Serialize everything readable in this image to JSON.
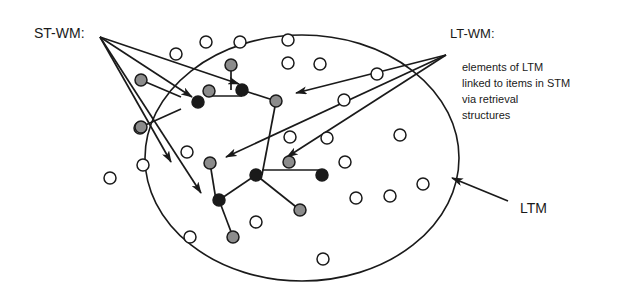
{
  "diagram": {
    "labels": {
      "st_wm": "ST-WM:",
      "lt_wm": "LT-WM:",
      "lt_wm_description": [
        "elements of LTM",
        "linked to items in STM",
        "via retrieval",
        "structures"
      ],
      "ltm": "LTM"
    },
    "colors": {
      "stroke": "#1a1a1a",
      "open_node_fill": "#ffffff",
      "gray_node_fill": "#8c8c8c",
      "dark_node_fill": "#1a1a1a",
      "background": "#ffffff"
    },
    "ltm_ellipse": {
      "cx": 302,
      "cy": 158,
      "rx": 157,
      "ry": 123
    },
    "node_radius": 6,
    "open_nodes": [
      [
        206,
        42
      ],
      [
        240,
        42
      ],
      [
        288,
        40
      ],
      [
        176,
        54
      ],
      [
        288,
        63
      ],
      [
        320,
        64
      ],
      [
        377,
        74
      ],
      [
        344,
        100
      ],
      [
        400,
        135
      ],
      [
        290,
        137
      ],
      [
        327,
        138
      ],
      [
        187,
        152
      ],
      [
        140,
        128
      ],
      [
        143,
        165
      ],
      [
        110,
        178
      ],
      [
        345,
        162
      ],
      [
        390,
        196
      ],
      [
        356,
        198
      ],
      [
        423,
        184
      ],
      [
        256,
        222
      ],
      [
        190,
        237
      ],
      [
        323,
        259
      ]
    ],
    "gray_nodes": [
      [
        231,
        65
      ],
      [
        141,
        80
      ],
      [
        209,
        91
      ],
      [
        276,
        101
      ],
      [
        141,
        127
      ],
      [
        210,
        163
      ],
      [
        289,
        162
      ],
      [
        300,
        210
      ],
      [
        233,
        237
      ]
    ],
    "dark_nodes": [
      [
        242,
        90
      ],
      [
        198,
        102
      ],
      [
        256,
        175
      ],
      [
        322,
        175
      ],
      [
        219,
        200
      ]
    ],
    "links": [
      [
        [
          231,
          65
        ],
        [
          231,
          90
        ]
      ],
      [
        [
          209,
          96
        ],
        [
          242,
          96
        ]
      ],
      [
        [
          242,
          90
        ],
        [
          276,
          101
        ]
      ],
      [
        [
          141,
          80
        ],
        [
          181,
          97
        ]
      ],
      [
        [
          141,
          127
        ],
        [
          181,
          109
        ]
      ],
      [
        [
          276,
          101
        ],
        [
          262,
          175
        ]
      ],
      [
        [
          256,
          175
        ],
        [
          219,
          200
        ]
      ],
      [
        [
          256,
          175
        ],
        [
          300,
          210
        ]
      ],
      [
        [
          262,
          170
        ],
        [
          322,
          170
        ]
      ],
      [
        [
          210,
          163
        ],
        [
          216,
          200
        ]
      ],
      [
        [
          219,
          200
        ],
        [
          233,
          237
        ]
      ]
    ],
    "st_wm_arrows": [
      {
        "from": [
          100,
          37
        ],
        "to": [
          239,
          84
        ]
      },
      {
        "from": [
          100,
          37
        ],
        "to": [
          192,
          97
        ]
      },
      {
        "from": [
          100,
          37
        ],
        "to": [
          201,
          193
        ]
      },
      {
        "from": [
          100,
          37
        ],
        "to": [
          171,
          162
        ]
      }
    ],
    "lt_wm_arrows": [
      {
        "from": [
          446,
          55
        ],
        "to": [
          296,
          93
        ]
      },
      {
        "from": [
          446,
          55
        ],
        "to": [
          226,
          157
        ]
      },
      {
        "from": [
          446,
          55
        ],
        "to": [
          287,
          157
        ]
      }
    ],
    "ltm_arrow": {
      "from": [
        508,
        201
      ],
      "to": [
        452,
        178
      ]
    },
    "extra_lines": [
      [
        [
          100,
          37
        ],
        [
          172,
          163
        ]
      ]
    ]
  }
}
